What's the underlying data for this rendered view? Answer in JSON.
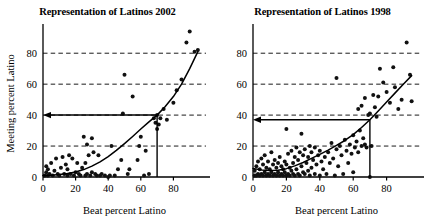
{
  "figure": {
    "background": "#ffffff",
    "ink": "#000000",
    "grid_color": "#000000",
    "panel_count": 2
  },
  "chart_data": [
    {
      "type": "scatter",
      "title": "Representation of Latinos 2002",
      "xlabel": "Beat percent Latino",
      "ylabel": "Meeting percent Latino",
      "xlim": [
        0,
        100
      ],
      "ylim": [
        0,
        95
      ],
      "xticks": [
        0,
        20,
        40,
        60,
        80
      ],
      "yticks": [
        0,
        20,
        40,
        60,
        80
      ],
      "xticklabels": [
        "0",
        "20",
        "40",
        "60",
        "80"
      ],
      "yticklabels": [
        "0",
        "20",
        "40",
        "60",
        "80"
      ],
      "grid": "horizontal-dashed",
      "legend": "none",
      "annotations": [
        {
          "kind": "reference-arrow",
          "description": "horizontal arrow pointing left from curve at x=70 to y-axis at y=40",
          "from": [
            70,
            40
          ],
          "to": [
            0,
            40
          ]
        },
        {
          "kind": "reference-drop-line",
          "description": "vertical line from curve down to x-axis at x=70",
          "from": [
            70,
            40
          ],
          "to": [
            70,
            0
          ]
        }
      ],
      "fit_curve": {
        "kind": "smoothed-exponential-fit",
        "points": [
          [
            0,
            1.0
          ],
          [
            5,
            1.2
          ],
          [
            10,
            1.6
          ],
          [
            15,
            2.2
          ],
          [
            20,
            3.2
          ],
          [
            25,
            4.8
          ],
          [
            30,
            7.0
          ],
          [
            35,
            9.8
          ],
          [
            40,
            13.2
          ],
          [
            45,
            17.2
          ],
          [
            50,
            21.6
          ],
          [
            55,
            26.2
          ],
          [
            60,
            31.0
          ],
          [
            65,
            35.6
          ],
          [
            70,
            40.0
          ],
          [
            75,
            45.5
          ],
          [
            80,
            52.0
          ],
          [
            85,
            60.0
          ],
          [
            90,
            70.0
          ],
          [
            95,
            81.0
          ]
        ]
      },
      "points": [
        [
          1,
          1
        ],
        [
          2,
          3
        ],
        [
          2,
          7
        ],
        [
          3,
          1
        ],
        [
          3,
          5
        ],
        [
          4,
          2
        ],
        [
          5,
          9
        ],
        [
          6,
          1
        ],
        [
          7,
          4
        ],
        [
          8,
          12
        ],
        [
          9,
          2
        ],
        [
          10,
          1
        ],
        [
          11,
          6
        ],
        [
          12,
          13
        ],
        [
          13,
          2
        ],
        [
          14,
          8
        ],
        [
          15,
          1
        ],
        [
          15,
          5
        ],
        [
          16,
          14
        ],
        [
          17,
          2
        ],
        [
          18,
          12
        ],
        [
          19,
          1
        ],
        [
          20,
          3
        ],
        [
          21,
          9
        ],
        [
          22,
          2
        ],
        [
          23,
          1
        ],
        [
          24,
          6
        ],
        [
          25,
          26
        ],
        [
          26,
          1
        ],
        [
          26,
          9
        ],
        [
          27,
          2
        ],
        [
          27,
          21
        ],
        [
          28,
          14
        ],
        [
          29,
          1
        ],
        [
          30,
          25
        ],
        [
          30,
          3
        ],
        [
          31,
          16
        ],
        [
          32,
          2
        ],
        [
          33,
          1
        ],
        [
          34,
          14
        ],
        [
          35,
          1
        ],
        [
          36,
          2
        ],
        [
          38,
          1
        ],
        [
          40,
          0
        ],
        [
          41,
          1
        ],
        [
          42,
          20
        ],
        [
          44,
          1
        ],
        [
          46,
          5
        ],
        [
          48,
          11
        ],
        [
          49,
          41
        ],
        [
          50,
          66
        ],
        [
          52,
          2
        ],
        [
          53,
          5
        ],
        [
          55,
          52
        ],
        [
          58,
          11
        ],
        [
          59,
          20
        ],
        [
          60,
          26
        ],
        [
          62,
          1
        ],
        [
          63,
          17
        ],
        [
          65,
          2
        ],
        [
          68,
          38
        ],
        [
          69,
          35
        ],
        [
          70,
          31
        ],
        [
          70,
          40
        ],
        [
          71,
          34
        ],
        [
          72,
          38
        ],
        [
          74,
          44
        ],
        [
          76,
          37
        ],
        [
          80,
          48
        ],
        [
          82,
          56
        ],
        [
          85,
          63
        ],
        [
          88,
          87
        ],
        [
          90,
          94
        ],
        [
          93,
          81
        ],
        [
          95,
          82
        ]
      ]
    },
    {
      "type": "scatter",
      "title": "Representation of Latinos 1998",
      "xlabel": "Beat percent Latino",
      "ylabel": "",
      "xlim": [
        0,
        100
      ],
      "ylim": [
        0,
        95
      ],
      "xticks": [
        0,
        20,
        40,
        60,
        80
      ],
      "yticks": [
        0,
        20,
        40,
        60,
        80
      ],
      "xticklabels": [
        "0",
        "20",
        "40",
        "60",
        "80"
      ],
      "yticklabels": [
        "0",
        "20",
        "40",
        "60",
        "80"
      ],
      "grid": "horizontal-dashed",
      "legend": "none",
      "annotations": [
        {
          "kind": "reference-arrow",
          "description": "horizontal arrow pointing left from curve at x=70 to y-axis at y=37",
          "from": [
            70,
            37
          ],
          "to": [
            0,
            37
          ]
        },
        {
          "kind": "reference-drop-line",
          "description": "vertical line from curve down to x-axis at x=70",
          "from": [
            70,
            37
          ],
          "to": [
            70,
            0
          ]
        }
      ],
      "fit_curve": {
        "kind": "smoothed-quadratic-fit",
        "points": [
          [
            0,
            5.5
          ],
          [
            5,
            4.6
          ],
          [
            10,
            4.2
          ],
          [
            15,
            4.4
          ],
          [
            20,
            5.4
          ],
          [
            25,
            7.2
          ],
          [
            30,
            9.4
          ],
          [
            35,
            12.0
          ],
          [
            40,
            14.6
          ],
          [
            45,
            17.4
          ],
          [
            50,
            20.4
          ],
          [
            55,
            23.6
          ],
          [
            60,
            27.4
          ],
          [
            65,
            32.0
          ],
          [
            70,
            37.0
          ],
          [
            75,
            42.6
          ],
          [
            80,
            48.4
          ],
          [
            85,
            54.2
          ],
          [
            90,
            60.0
          ],
          [
            95,
            65.5
          ]
        ]
      },
      "points": [
        [
          1,
          1
        ],
        [
          1,
          4
        ],
        [
          2,
          1
        ],
        [
          2,
          7
        ],
        [
          3,
          2
        ],
        [
          3,
          10
        ],
        [
          4,
          1
        ],
        [
          4,
          5
        ],
        [
          5,
          2
        ],
        [
          5,
          12
        ],
        [
          6,
          1
        ],
        [
          6,
          8
        ],
        [
          7,
          3
        ],
        [
          7,
          14
        ],
        [
          8,
          1
        ],
        [
          8,
          6
        ],
        [
          9,
          2
        ],
        [
          9,
          10
        ],
        [
          10,
          1
        ],
        [
          10,
          5
        ],
        [
          11,
          3
        ],
        [
          11,
          16
        ],
        [
          12,
          1
        ],
        [
          12,
          8
        ],
        [
          13,
          2
        ],
        [
          13,
          11
        ],
        [
          14,
          1
        ],
        [
          14,
          6
        ],
        [
          15,
          3
        ],
        [
          15,
          9
        ],
        [
          16,
          1
        ],
        [
          16,
          13
        ],
        [
          17,
          2
        ],
        [
          17,
          7
        ],
        [
          18,
          1
        ],
        [
          18,
          5
        ],
        [
          19,
          3
        ],
        [
          19,
          10
        ],
        [
          20,
          1
        ],
        [
          20,
          8
        ],
        [
          20,
          31
        ],
        [
          21,
          2
        ],
        [
          21,
          15
        ],
        [
          22,
          1
        ],
        [
          22,
          6
        ],
        [
          23,
          4
        ],
        [
          23,
          17
        ],
        [
          24,
          2
        ],
        [
          24,
          9
        ],
        [
          25,
          1
        ],
        [
          25,
          13
        ],
        [
          26,
          5
        ],
        [
          26,
          19
        ],
        [
          27,
          2
        ],
        [
          27,
          11
        ],
        [
          28,
          1
        ],
        [
          28,
          16
        ],
        [
          29,
          7
        ],
        [
          29,
          28
        ],
        [
          30,
          3
        ],
        [
          30,
          14
        ],
        [
          31,
          2
        ],
        [
          31,
          18
        ],
        [
          32,
          9
        ],
        [
          33,
          4
        ],
        [
          33,
          13
        ],
        [
          34,
          1
        ],
        [
          34,
          20
        ],
        [
          35,
          6
        ],
        [
          35,
          16
        ],
        [
          36,
          11
        ],
        [
          37,
          2
        ],
        [
          37,
          19
        ],
        [
          38,
          8
        ],
        [
          39,
          14
        ],
        [
          40,
          1
        ],
        [
          40,
          17
        ],
        [
          41,
          10
        ],
        [
          42,
          5
        ],
        [
          43,
          13
        ],
        [
          44,
          2
        ],
        [
          45,
          16
        ],
        [
          46,
          9
        ],
        [
          47,
          22
        ],
        [
          48,
          12
        ],
        [
          49,
          1
        ],
        [
          50,
          18
        ],
        [
          50,
          64
        ],
        [
          51,
          7
        ],
        [
          52,
          20
        ],
        [
          53,
          14
        ],
        [
          54,
          2
        ],
        [
          55,
          24
        ],
        [
          56,
          17
        ],
        [
          57,
          9
        ],
        [
          58,
          21
        ],
        [
          59,
          15
        ],
        [
          60,
          3
        ],
        [
          60,
          27
        ],
        [
          61,
          19
        ],
        [
          62,
          23
        ],
        [
          63,
          16
        ],
        [
          63,
          44
        ],
        [
          64,
          30
        ],
        [
          65,
          20
        ],
        [
          65,
          46
        ],
        [
          66,
          25
        ],
        [
          67,
          21
        ],
        [
          67,
          51
        ],
        [
          68,
          19
        ],
        [
          69,
          40
        ],
        [
          70,
          0
        ],
        [
          70,
          41
        ],
        [
          71,
          20
        ],
        [
          72,
          53
        ],
        [
          73,
          45
        ],
        [
          74,
          39
        ],
        [
          75,
          52
        ],
        [
          76,
          70
        ],
        [
          78,
          61
        ],
        [
          80,
          55
        ],
        [
          82,
          48
        ],
        [
          84,
          71
        ],
        [
          85,
          58
        ],
        [
          87,
          44
        ],
        [
          89,
          50
        ],
        [
          92,
          87
        ],
        [
          94,
          66
        ],
        [
          95,
          49
        ]
      ]
    }
  ]
}
